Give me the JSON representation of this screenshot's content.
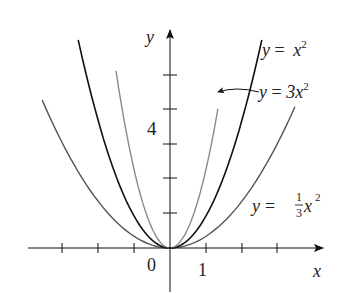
{
  "chart_data": {
    "type": "line",
    "title": "",
    "xlabel": "x",
    "ylabel": "y",
    "x_tick_labels": [
      {
        "value": 0,
        "label": "0"
      },
      {
        "value": 1,
        "label": "1"
      }
    ],
    "y_tick_labels": [
      {
        "value": 4,
        "label": "4"
      }
    ],
    "x_ticks": [
      -3,
      -2,
      -1,
      1,
      2,
      3
    ],
    "y_ticks": [
      1,
      2,
      3,
      4,
      5
    ],
    "xlim": [
      -4.2,
      4.5
    ],
    "ylim": [
      -1.3,
      7
    ],
    "grid": false,
    "legend": "inline labels",
    "series": [
      {
        "name": "y = x^2",
        "label_parts": {
          "lhs": "y",
          "eq": " = ",
          "rhs": "x",
          "sup": "2"
        },
        "coef": 1,
        "color": "#111111",
        "x_range": [
          -2.55,
          2.55
        ]
      },
      {
        "name": "y = 3x^2",
        "label_parts": {
          "lhs": "y",
          "eq": " = ",
          "rhs": "3x",
          "sup": "2"
        },
        "coef": 3,
        "color": "#8a8a8a",
        "x_range": [
          -1.5,
          1.33
        ],
        "annotation": "arrow pointing to curve"
      },
      {
        "name": "y = (1/3)x^2",
        "label_parts": {
          "lhs": "y",
          "eq": " = ",
          "num": "1",
          "den": "3",
          "rhs": "x",
          "sup": "2"
        },
        "coef": 0.3333,
        "color": "#555555",
        "x_range": [
          -3.55,
          3.47
        ]
      }
    ]
  }
}
